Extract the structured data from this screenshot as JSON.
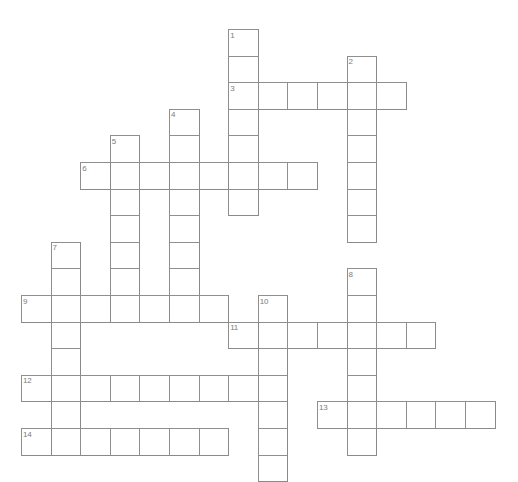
{
  "document": {
    "type": "crossword-puzzle-grid",
    "title": "",
    "background_color": "#ffffff",
    "cell_border_color": "#8a8a8a",
    "cell_fill_color": "#ffffff",
    "number_color": "#7b7b7b",
    "canvas": {
      "width": 518,
      "height": 466
    }
  },
  "grid": {
    "cell_width": 29.6,
    "cell_height": 26.6,
    "origin_x": 21,
    "origin_y": 29,
    "columns": 16,
    "rows": 16
  },
  "entries": [
    {
      "number": "1",
      "direction": "down",
      "col": 7,
      "row": 0,
      "length": 7
    },
    {
      "number": "2",
      "direction": "down",
      "col": 11,
      "row": 1,
      "length": 7
    },
    {
      "number": "3",
      "direction": "across",
      "col": 7,
      "row": 2,
      "length": 6
    },
    {
      "number": "4",
      "direction": "down",
      "col": 5,
      "row": 3,
      "length": 8
    },
    {
      "number": "5",
      "direction": "down",
      "col": 3,
      "row": 4,
      "length": 7
    },
    {
      "number": "6",
      "direction": "across",
      "col": 2,
      "row": 5,
      "length": 8
    },
    {
      "number": "7",
      "direction": "down",
      "col": 1,
      "row": 8,
      "length": 8
    },
    {
      "number": "8",
      "direction": "down",
      "col": 11,
      "row": 9,
      "length": 7
    },
    {
      "number": "9",
      "direction": "across",
      "col": 0,
      "row": 10,
      "length": 7
    },
    {
      "number": "10",
      "direction": "down",
      "col": 8,
      "row": 10,
      "length": 7
    },
    {
      "number": "11",
      "direction": "across",
      "col": 7,
      "row": 11,
      "length": 7
    },
    {
      "number": "12",
      "direction": "across",
      "col": 0,
      "row": 13,
      "length": 8
    },
    {
      "number": "13",
      "direction": "across",
      "col": 10,
      "row": 14,
      "length": 6
    },
    {
      "number": "14",
      "direction": "across",
      "col": 0,
      "row": 15,
      "length": 7
    }
  ],
  "numbers_visible": [
    "1",
    "2",
    "3",
    "4",
    "5",
    "6",
    "7",
    "8",
    "9",
    "10",
    "11",
    "12",
    "13",
    "14"
  ],
  "letters": []
}
